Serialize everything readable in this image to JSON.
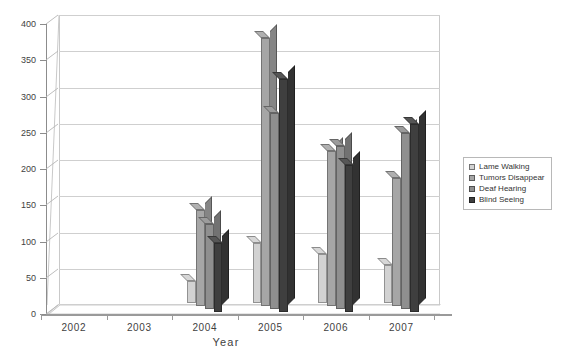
{
  "chart_data": {
    "type": "bar",
    "title": "",
    "xlabel": "Year",
    "ylabel": "",
    "categories": [
      "2002",
      "2003",
      "2004",
      "2005",
      "2006",
      "2007"
    ],
    "series": [
      {
        "name": "Lame Walking",
        "color": "#d2d2d2",
        "values": [
          0,
          0,
          30,
          83,
          67,
          52
        ]
      },
      {
        "name": "Tumors Disappear",
        "color": "#a6a6a6",
        "values": [
          0,
          0,
          133,
          370,
          214,
          176
        ]
      },
      {
        "name": "Deaf Hearing",
        "color": "#8f8f8f",
        "values": [
          0,
          0,
          117,
          270,
          225,
          243
        ]
      },
      {
        "name": "Blind Seeing",
        "color": "#3f3f3f",
        "values": [
          0,
          0,
          95,
          322,
          203,
          259
        ]
      }
    ],
    "ylim": [
      0,
      400
    ],
    "yticks": [
      0,
      50,
      100,
      150,
      200,
      250,
      300,
      350,
      400
    ],
    "ytick_labels": [
      "0",
      "50",
      "100",
      "150",
      "200",
      "250",
      "300",
      "350",
      "400"
    ],
    "grid": true,
    "legend_position": "right",
    "style": "3d-clustered-column"
  },
  "legend": {
    "items": [
      {
        "label": "Lame Walking"
      },
      {
        "label": "Tumors Disappear"
      },
      {
        "label": "Deaf Hearing"
      },
      {
        "label": "Blind Seeing"
      }
    ]
  },
  "axes": {
    "x_title": "Year"
  }
}
